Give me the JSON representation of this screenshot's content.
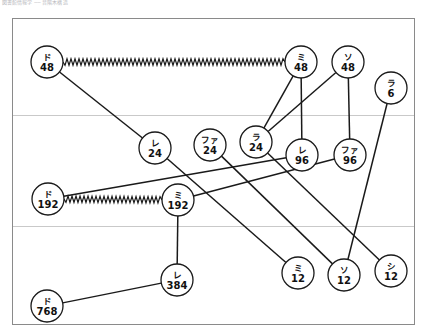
{
  "header": {
    "text": "図書館情報学 ── 音階木構造"
  },
  "frame": {
    "border_color": "#8a8a8a",
    "background": "#ffffff",
    "x": 12,
    "y": 18,
    "width": 402,
    "height": 306
  },
  "style": {
    "node_fill": "#ffffff",
    "node_stroke": "#1a1a1a",
    "edge_color": "#1a1a1a",
    "divider_color": "#c9c9c9",
    "node_radius": 16
  },
  "dividers": [
    {
      "name": "divider-upper",
      "y": 115
    },
    {
      "name": "divider-lower",
      "y": 226
    }
  ],
  "chart_data": {
    "type": "diagram",
    "subtype": "node-link-graph",
    "title": "",
    "nodes": [
      {
        "id": "do48",
        "label_top": "ド",
        "label_bottom": "48",
        "x": 47,
        "y": 62
      },
      {
        "id": "mi48",
        "label_top": "ミ",
        "label_bottom": "48",
        "x": 301,
        "y": 62
      },
      {
        "id": "so48",
        "label_top": "ソ",
        "label_bottom": "48",
        "x": 348,
        "y": 62
      },
      {
        "id": "ra6",
        "label_top": "ラ",
        "label_bottom": "6",
        "x": 391,
        "y": 88
      },
      {
        "id": "re24",
        "label_top": "レ",
        "label_bottom": "24",
        "x": 155,
        "y": 148
      },
      {
        "id": "fa24",
        "label_top": "ファ",
        "label_bottom": "24",
        "x": 210,
        "y": 145
      },
      {
        "id": "ra24",
        "label_top": "ラ",
        "label_bottom": "24",
        "x": 256,
        "y": 142
      },
      {
        "id": "re96",
        "label_top": "レ",
        "label_bottom": "96",
        "x": 302,
        "y": 155
      },
      {
        "id": "fa96",
        "label_top": "ファ",
        "label_bottom": "96",
        "x": 350,
        "y": 155
      },
      {
        "id": "do192",
        "label_top": "ド",
        "label_bottom": "192",
        "x": 48,
        "y": 199
      },
      {
        "id": "mi192",
        "label_top": "ミ",
        "label_bottom": "192",
        "x": 178,
        "y": 200
      },
      {
        "id": "re384",
        "label_top": "レ",
        "label_bottom": "384",
        "x": 177,
        "y": 280
      },
      {
        "id": "mi12",
        "label_top": "ミ",
        "label_bottom": "12",
        "x": 298,
        "y": 273
      },
      {
        "id": "so12",
        "label_top": "ソ",
        "label_bottom": "12",
        "x": 344,
        "y": 275
      },
      {
        "id": "shi12",
        "label_top": "シ",
        "label_bottom": "12",
        "x": 391,
        "y": 271
      },
      {
        "id": "do768",
        "label_top": "ド",
        "label_bottom": "768",
        "x": 47,
        "y": 306
      }
    ],
    "edges": [
      {
        "from": "do48",
        "to": "mi48",
        "style": "zigzag"
      },
      {
        "from": "do192",
        "to": "mi192",
        "style": "zigzag"
      },
      {
        "from": "do48",
        "to": "re24",
        "style": "straight"
      },
      {
        "from": "mi48",
        "to": "re96",
        "style": "straight"
      },
      {
        "from": "mi48",
        "to": "ra24",
        "style": "straight"
      },
      {
        "from": "so48",
        "to": "fa96",
        "style": "straight"
      },
      {
        "from": "so48",
        "to": "ra24",
        "style": "straight"
      },
      {
        "from": "ra6",
        "to": "so12",
        "style": "straight"
      },
      {
        "from": "re24",
        "to": "mi12",
        "style": "straight"
      },
      {
        "from": "fa24",
        "to": "so12",
        "style": "straight"
      },
      {
        "from": "ra24",
        "to": "shi12",
        "style": "straight"
      },
      {
        "from": "re96",
        "to": "do192",
        "style": "straight"
      },
      {
        "from": "fa96",
        "to": "mi192",
        "style": "straight"
      },
      {
        "from": "mi192",
        "to": "re384",
        "style": "straight"
      },
      {
        "from": "re384",
        "to": "do768",
        "style": "straight"
      }
    ]
  }
}
